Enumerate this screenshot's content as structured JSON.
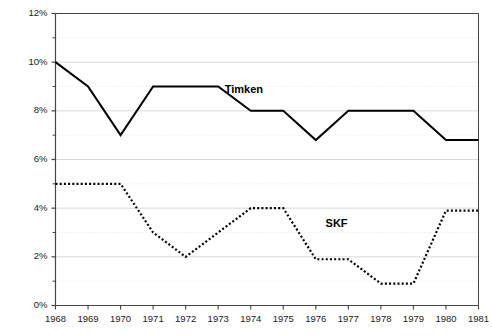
{
  "chart_data": {
    "type": "line",
    "title": "",
    "subtitle": "",
    "xlabel": "",
    "ylabel": "",
    "categories": [
      1968,
      1969,
      1970,
      1971,
      1972,
      1973,
      1974,
      1975,
      1976,
      1977,
      1978,
      1979,
      1980,
      1981
    ],
    "xtick_labels": [
      "1968",
      "1969",
      "1970",
      "1971",
      "1972",
      "1973",
      "1974",
      "1975",
      "1976",
      "1977",
      "1978",
      "1979",
      "1980",
      "1981"
    ],
    "ytick_labels": [
      "0%",
      "2%",
      "4%",
      "6%",
      "8%",
      "10%",
      "12%"
    ],
    "ytick_values": [
      0,
      2,
      4,
      6,
      8,
      10,
      12
    ],
    "yminor_values": [
      1,
      3,
      5,
      7,
      9,
      11
    ],
    "ylim": [
      0,
      12
    ],
    "xlim": [
      1968,
      1981
    ],
    "grid": true,
    "grid_axis": "y",
    "legend": "inline-labels",
    "series": [
      {
        "name": "Timken",
        "style": "solid",
        "color": "#000000",
        "label_x": 1973.2,
        "label_y": 8.85,
        "values": [
          10.0,
          9.0,
          7.0,
          9.0,
          9.0,
          9.0,
          8.0,
          8.0,
          6.8,
          8.0,
          8.0,
          8.0,
          6.8,
          6.8
        ]
      },
      {
        "name": "SKF",
        "style": "dotted",
        "color": "#000000",
        "label_x": 1976.3,
        "label_y": 3.35,
        "values": [
          5.0,
          5.0,
          5.0,
          3.0,
          2.0,
          3.0,
          4.0,
          4.0,
          1.9,
          1.9,
          0.9,
          0.9,
          3.9,
          3.9
        ]
      }
    ],
    "annotations": [
      {
        "text": "Timken",
        "series": "Timken"
      },
      {
        "text": "SKF",
        "series": "SKF"
      }
    ],
    "colors": {
      "axis": "#444444",
      "grid_major": "#d8d8d8",
      "grid_minor": "#e8e8e8",
      "line": "#000000",
      "text": "#1a1a1a",
      "background": "#ffffff"
    }
  }
}
